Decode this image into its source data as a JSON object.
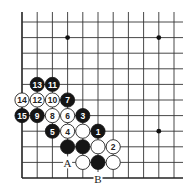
{
  "diagram": {
    "type": "go-board-corner",
    "grid": {
      "columns": 11,
      "rows": 11,
      "left_edge": true,
      "bottom_edge": true,
      "origin_x": 22,
      "origin_y": 178,
      "spacing_x": 15.2,
      "spacing_y": 15.6,
      "extend_right": 183,
      "extend_top": 12
    },
    "star_points": [
      {
        "col": 3,
        "row": 9
      },
      {
        "col": 9,
        "row": 9
      },
      {
        "col": 9,
        "row": 3
      }
    ],
    "stones": [
      {
        "col": 5,
        "row": 3,
        "color": "black",
        "label": "1"
      },
      {
        "col": 6,
        "row": 2,
        "color": "white",
        "label": "2"
      },
      {
        "col": 4,
        "row": 4,
        "color": "black",
        "label": "3"
      },
      {
        "col": 3,
        "row": 3,
        "color": "white",
        "label": "4"
      },
      {
        "col": 2,
        "row": 3,
        "color": "black",
        "label": "5"
      },
      {
        "col": 3,
        "row": 4,
        "color": "white",
        "label": "6"
      },
      {
        "col": 3,
        "row": 5,
        "color": "black",
        "label": "7"
      },
      {
        "col": 2,
        "row": 4,
        "color": "white",
        "label": "8"
      },
      {
        "col": 1,
        "row": 4,
        "color": "black",
        "label": "9"
      },
      {
        "col": 2,
        "row": 5,
        "color": "white",
        "label": "10"
      },
      {
        "col": 2,
        "row": 6,
        "color": "black",
        "label": "11"
      },
      {
        "col": 1,
        "row": 5,
        "color": "white",
        "label": "12"
      },
      {
        "col": 1,
        "row": 6,
        "color": "black",
        "label": "13"
      },
      {
        "col": 0,
        "row": 5,
        "color": "white",
        "label": "14"
      },
      {
        "col": 0,
        "row": 4,
        "color": "black",
        "label": "15"
      },
      {
        "col": 4,
        "row": 3,
        "color": "white",
        "label": ""
      },
      {
        "col": 3,
        "row": 2,
        "color": "black",
        "label": ""
      },
      {
        "col": 4,
        "row": 2,
        "color": "black",
        "label": ""
      },
      {
        "col": 5,
        "row": 2,
        "color": "white",
        "label": ""
      },
      {
        "col": 4,
        "row": 1,
        "color": "white",
        "label": ""
      },
      {
        "col": 5,
        "row": 1,
        "color": "black",
        "label": ""
      },
      {
        "col": 6,
        "row": 1,
        "color": "white",
        "label": ""
      }
    ],
    "markers": [
      {
        "col": 3,
        "row": 1,
        "label": "A"
      },
      {
        "col": 5,
        "row": 0,
        "label": "B"
      }
    ],
    "colors": {
      "black_stone": "#151515",
      "white_stone": "#ffffff",
      "line": "#333333"
    }
  }
}
